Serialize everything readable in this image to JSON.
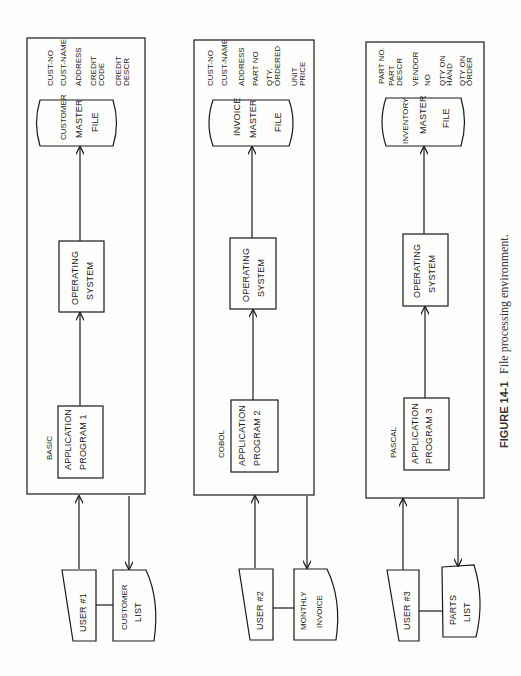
{
  "caption": {
    "label": "FIGURE 14-1",
    "text": "File processing environment."
  },
  "panels": [
    {
      "language": "BASIC",
      "app_program": [
        "APPLICATION",
        "PROGRAM 1"
      ],
      "os": [
        "OPERATING",
        "SYSTEM"
      ],
      "file": [
        "CUSTOMER",
        "MASTER",
        "FILE"
      ],
      "fields": [
        "CUST-NO",
        "CUST-NAME",
        "ADDRESS",
        "CREDIT CODE",
        "CREDIT DESCR"
      ],
      "user": "USER #1",
      "report": [
        "CUSTOMER",
        "LIST"
      ]
    },
    {
      "language": "COBOL",
      "app_program": [
        "APPLICATION",
        "PROGRAM 2"
      ],
      "os": [
        "OPERATING",
        "SYSTEM"
      ],
      "file": [
        "INVOICE",
        "MASTER",
        "FILE"
      ],
      "fields": [
        "CUST-NO",
        "CUST-NAME",
        "ADDRESS",
        "PART NO",
        "QTY. ORDERED",
        "UNIT PRICE"
      ],
      "user": "USER #2",
      "report": [
        "MONTHLY",
        "INVOICE"
      ]
    },
    {
      "language": "PASCAL",
      "app_program": [
        "APPLICATION",
        "PROGRAM 3"
      ],
      "os": [
        "OPERATING",
        "SYSTEM"
      ],
      "file": [
        "INVENTORY",
        "MASTER",
        "FILE"
      ],
      "fields": [
        "PART NO.",
        "PART DESCR",
        "VENDOR NO",
        "QTY ON HAND",
        "QTY ON ORDER"
      ],
      "user": "USER #3",
      "report": [
        "PARTS",
        "LIST"
      ]
    }
  ]
}
